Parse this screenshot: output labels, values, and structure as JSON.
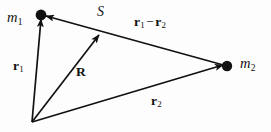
{
  "figure": {
    "background_color": "#fdfdfd",
    "stroke_color": "#111111",
    "width": 271,
    "height": 132
  },
  "labels": {
    "mass1": {
      "symbol": "m",
      "subscript": "1"
    },
    "mass2": {
      "symbol": "m",
      "subscript": "2"
    },
    "separation_point": {
      "symbol": "S"
    },
    "vector_r1": {
      "symbol": "r",
      "subscript": "1"
    },
    "vector_R": {
      "symbol": "R"
    },
    "vector_r2": {
      "symbol": "r",
      "subscript": "2"
    },
    "vector_difference": {
      "symbol_a": "r",
      "subscript_a": "1",
      "operator": "−",
      "symbol_b": "r",
      "subscript_b": "2"
    }
  },
  "geometry": {
    "origin": {
      "x": 32,
      "y": 122
    },
    "mass1_point": {
      "x": 41,
      "y": 15
    },
    "mass2_point": {
      "x": 227,
      "y": 66
    },
    "point_s": {
      "x": 100,
      "y": 33
    },
    "vectors": [
      {
        "name": "r1",
        "from": "origin",
        "to": "mass1_point",
        "arrow_at": "head"
      },
      {
        "name": "R",
        "from": "origin",
        "to": "point_s",
        "arrow_at": "head"
      },
      {
        "name": "r2",
        "from": "origin",
        "to": "mass2_point",
        "arrow_at": "head"
      },
      {
        "name": "r1-r2",
        "from": "mass2_point",
        "to": "mass1_point",
        "arrow_at": "head"
      }
    ]
  }
}
